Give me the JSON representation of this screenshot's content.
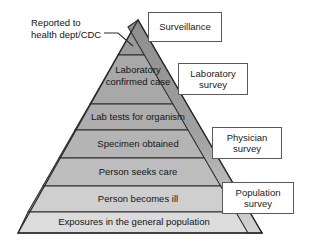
{
  "figure": {
    "type": "surveillance-pyramid-diagram",
    "title_annotation": "Reported to\nhealth dept/CDC"
  },
  "pyramid": {
    "apex": {
      "x": 138,
      "y": 20
    },
    "base_left": {
      "x": 18,
      "y": 233
    },
    "base_right": {
      "x": 262,
      "y": 233
    },
    "tiers": [
      {
        "label": "",
        "fill": "#9a9a9a",
        "top_y": 20,
        "bottom_y": 55
      },
      {
        "label": "Laboratory\nconfirmed case",
        "fill": "#a8a8a8",
        "top_y": 55,
        "bottom_y": 104
      },
      {
        "label": "Lab tests for organism",
        "fill": "#adadad",
        "top_y": 104,
        "bottom_y": 130
      },
      {
        "label": "Specimen obtained",
        "fill": "#b4b4b4",
        "top_y": 130,
        "bottom_y": 158
      },
      {
        "label": "Person seeks care",
        "fill": "#bdbdbd",
        "top_y": 158,
        "bottom_y": 186
      },
      {
        "label": "Person becomes ill",
        "fill": "#cfcfcf",
        "top_y": 186,
        "bottom_y": 212
      },
      {
        "label": "Exposures in the general population",
        "fill": "#dcdcdc",
        "top_y": 212,
        "bottom_y": 233
      }
    ],
    "right_facet": {
      "description": "darker shaded right edge band of pyramid",
      "fill_top": "#8f8f8f",
      "fill_bottom": "#d2d2d2"
    }
  },
  "callouts": [
    {
      "id": "surveillance",
      "label": "Surveillance"
    },
    {
      "id": "laboratory",
      "label": "Laboratory\nsurvey"
    },
    {
      "id": "physician",
      "label": "Physician\nsurvey"
    },
    {
      "id": "population",
      "label": "Population\nsurvey"
    }
  ],
  "colors": {
    "outline": "#2b2b2b",
    "box_border": "#5a5a5a",
    "text": "#141414",
    "background": "#ffffff"
  }
}
